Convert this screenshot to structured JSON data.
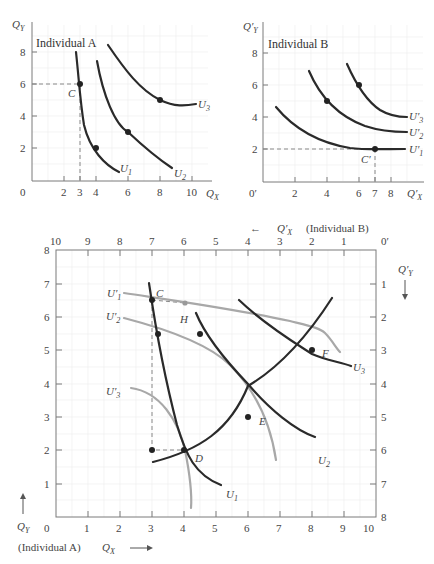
{
  "panel_a": {
    "title": "Individual A",
    "y_label": "Q",
    "y_sub": "Y",
    "x_label": "Q",
    "x_sub": "X",
    "origin_label": "0",
    "x_ticks": [
      "2",
      "3",
      "4",
      "6",
      "8",
      "10"
    ],
    "y_ticks": [
      "2",
      "4",
      "6",
      "8"
    ],
    "point_label": "C",
    "curves": [
      "U",
      "U",
      "U"
    ],
    "curve_subs": [
      "1",
      "2",
      "3"
    ]
  },
  "panel_b": {
    "title": "Individual B",
    "y_label": "Q′",
    "y_sub": "Y",
    "x_label": "Q′",
    "x_sub": "X",
    "origin_label": "0′",
    "x_ticks": [
      "2",
      "4",
      "6",
      "7",
      "8"
    ],
    "y_ticks": [
      "2",
      "4",
      "6",
      "8"
    ],
    "point_label": "C′",
    "curves": [
      "U′",
      "U′",
      "U′"
    ],
    "curve_subs": [
      "1",
      "2",
      "3"
    ]
  },
  "box": {
    "top_caption_arrow": "←",
    "top_caption_q": "Q′",
    "top_caption_sub": "X",
    "top_caption_who": "(Individual B)",
    "bottom_caption_who": "(Individual A)",
    "bottom_caption_q": "Q",
    "bottom_caption_sub": "X",
    "bottom_caption_arrow": "⟶",
    "left_label_q": "Q",
    "left_label_sub": "Y",
    "right_label_q": "Q′",
    "right_label_sub": "Y",
    "origin_a": "0",
    "origin_b": "0′",
    "bottom_ticks": [
      "1",
      "2",
      "3",
      "4",
      "5",
      "6",
      "7",
      "8",
      "9",
      "10"
    ],
    "top_ticks": [
      "10",
      "9",
      "8",
      "7",
      "6",
      "5",
      "4",
      "3",
      "2",
      "1"
    ],
    "left_ticks": [
      "1",
      "2",
      "3",
      "4",
      "5",
      "6",
      "7",
      "8"
    ],
    "right_ticks": [
      "1",
      "2",
      "3",
      "4",
      "5",
      "6",
      "7",
      "8"
    ],
    "point_labels": {
      "C": "C",
      "H": "H",
      "D": "D",
      "E": "E",
      "F": "F"
    },
    "curve_labels": {
      "U1": "U",
      "U1_sub": "1",
      "U2": "U",
      "U2_sub": "2",
      "U3": "U",
      "U3_sub": "3",
      "U1p": "U′",
      "U1p_sub": "1",
      "U2p": "U′",
      "U2p_sub": "2",
      "U3p": "U′",
      "U3p_sub": "3"
    }
  },
  "colors": {
    "individual_a_curves": "#2a2a2a",
    "individual_b_curves": "#a8a8a8",
    "axes": "#7a7a7a",
    "grid": "#ececec"
  }
}
